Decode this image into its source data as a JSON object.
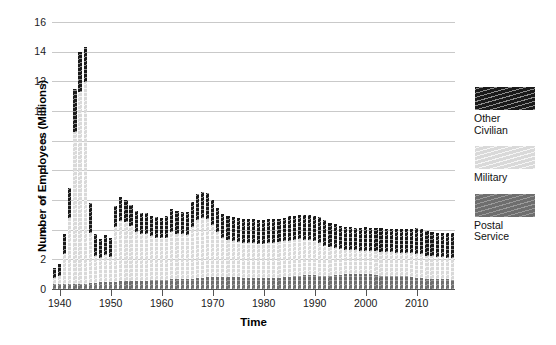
{
  "chart_data": {
    "type": "bar",
    "stacked": true,
    "title": "",
    "xlabel": "Time",
    "ylabel": "Number of Employees (Millions)",
    "ylim": [
      0,
      16
    ],
    "xlim": [
      1939,
      2017
    ],
    "grid": true,
    "y_ticks": [
      0,
      2,
      4,
      6,
      0,
      8,
      10,
      12,
      14,
      16
    ],
    "y_tick_labels": [
      "0",
      "2",
      "4",
      "6",
      "0",
      "8",
      "10",
      "12",
      "14",
      "16"
    ],
    "x_tick_labels": [
      "1940",
      "1950",
      "1960",
      "1970",
      "1980",
      "1990",
      "2000",
      "2010"
    ],
    "x_ticks": [
      1940,
      1950,
      1960,
      1970,
      1980,
      1990,
      2000,
      2010
    ],
    "legend_position": "right",
    "categories": [
      1939,
      1940,
      1941,
      1942,
      1943,
      1944,
      1945,
      1946,
      1947,
      1948,
      1949,
      1950,
      1951,
      1952,
      1953,
      1954,
      1955,
      1956,
      1957,
      1958,
      1959,
      1960,
      1961,
      1962,
      1963,
      1964,
      1965,
      1966,
      1967,
      1968,
      1969,
      1970,
      1971,
      1972,
      1973,
      1974,
      1975,
      1976,
      1977,
      1978,
      1979,
      1980,
      1981,
      1982,
      1983,
      1984,
      1985,
      1986,
      1987,
      1988,
      1989,
      1990,
      1991,
      1992,
      1993,
      1994,
      1995,
      1996,
      1997,
      1998,
      1999,
      2000,
      2001,
      2002,
      2003,
      2004,
      2005,
      2006,
      2007,
      2008,
      2009,
      2010,
      2011,
      2012,
      2013,
      2014,
      2015,
      2016,
      2017
    ],
    "series": [
      {
        "name": "Postal Service",
        "color": "#6e6e6e",
        "values": [
          0.28,
          0.3,
          0.32,
          0.33,
          0.32,
          0.31,
          0.32,
          0.36,
          0.38,
          0.4,
          0.42,
          0.43,
          0.45,
          0.46,
          0.47,
          0.47,
          0.48,
          0.49,
          0.51,
          0.52,
          0.53,
          0.55,
          0.56,
          0.58,
          0.59,
          0.59,
          0.6,
          0.62,
          0.67,
          0.69,
          0.73,
          0.74,
          0.71,
          0.7,
          0.7,
          0.71,
          0.7,
          0.67,
          0.66,
          0.67,
          0.67,
          0.67,
          0.67,
          0.67,
          0.68,
          0.71,
          0.74,
          0.78,
          0.8,
          0.82,
          0.82,
          0.82,
          0.79,
          0.79,
          0.79,
          0.84,
          0.85,
          0.88,
          0.9,
          0.9,
          0.9,
          0.88,
          0.87,
          0.84,
          0.8,
          0.79,
          0.8,
          0.8,
          0.79,
          0.76,
          0.71,
          0.67,
          0.65,
          0.61,
          0.59,
          0.59,
          0.59,
          0.58,
          0.57
        ]
      },
      {
        "name": "Military",
        "color": "#d9d9d9",
        "values": [
          0.37,
          0.46,
          1.8,
          3.9,
          9.1,
          11.5,
          12.1,
          3.0,
          1.6,
          1.45,
          1.62,
          1.46,
          3.25,
          3.64,
          3.56,
          3.32,
          2.94,
          2.81,
          2.8,
          2.64,
          2.55,
          2.48,
          2.49,
          2.81,
          2.7,
          2.69,
          2.66,
          3.09,
          3.45,
          3.55,
          3.46,
          3.07,
          2.71,
          2.33,
          2.25,
          2.16,
          2.13,
          2.08,
          2.07,
          2.06,
          2.03,
          2.05,
          2.08,
          2.11,
          2.12,
          2.14,
          2.15,
          2.17,
          2.17,
          2.13,
          2.13,
          2.04,
          1.99,
          1.81,
          1.71,
          1.61,
          1.52,
          1.47,
          1.44,
          1.41,
          1.39,
          1.38,
          1.38,
          1.41,
          1.43,
          1.41,
          1.39,
          1.38,
          1.38,
          1.4,
          1.42,
          1.43,
          1.43,
          1.39,
          1.36,
          1.33,
          1.31,
          1.3,
          1.3
        ]
      },
      {
        "name": "Other Civilian",
        "color": "#1a1a1a",
        "values": [
          0.6,
          0.75,
          1.15,
          1.85,
          2.55,
          2.4,
          2.1,
          1.8,
          1.3,
          1.15,
          1.18,
          1.15,
          1.3,
          1.4,
          1.32,
          1.25,
          1.25,
          1.25,
          1.25,
          1.23,
          1.25,
          1.25,
          1.33,
          1.38,
          1.37,
          1.36,
          1.38,
          1.5,
          1.6,
          1.6,
          1.55,
          1.5,
          1.46,
          1.45,
          1.43,
          1.43,
          1.42,
          1.43,
          1.45,
          1.48,
          1.46,
          1.44,
          1.42,
          1.41,
          1.42,
          1.43,
          1.47,
          1.45,
          1.45,
          1.47,
          1.5,
          1.53,
          1.55,
          1.53,
          1.47,
          1.45,
          1.41,
          1.38,
          1.37,
          1.36,
          1.38,
          1.48,
          1.38,
          1.4,
          1.4,
          1.4,
          1.41,
          1.42,
          1.42,
          1.44,
          1.49,
          1.55,
          1.52,
          1.48,
          1.46,
          1.46,
          1.46,
          1.47,
          1.47
        ]
      }
    ]
  },
  "legend": {
    "entries": [
      {
        "label": "Other\nCivilian",
        "swatch": "hatched-black-swatch"
      },
      {
        "label": "Military",
        "swatch": "hatched-lightgray-swatch"
      },
      {
        "label": "Postal\nService",
        "swatch": "hatched-gray-swatch"
      }
    ]
  },
  "axes": {
    "y_title": "Number of Employees (Millions)",
    "x_title": "Time"
  }
}
